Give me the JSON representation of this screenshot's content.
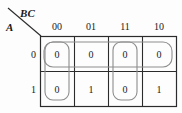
{
  "kmap": {
    "corner": {
      "col_vars": "BC",
      "row_var": "A"
    },
    "col_headers": [
      "00",
      "01",
      "11",
      "10"
    ],
    "row_headers": [
      "0",
      "1"
    ],
    "rows": [
      {
        "label": "0",
        "cells": [
          "0",
          "0",
          "0",
          "0"
        ]
      },
      {
        "label": "1",
        "cells": [
          "0",
          "1",
          "0",
          "1"
        ]
      }
    ],
    "groups": [
      {
        "name": "row-0-group",
        "orientation": "horizontal",
        "row": 0,
        "cols": [
          0,
          1,
          2,
          3
        ]
      },
      {
        "name": "col-00-group",
        "orientation": "vertical",
        "col": 0,
        "rows": [
          0,
          1
        ]
      },
      {
        "name": "col-11-group",
        "orientation": "vertical",
        "col": 2,
        "rows": [
          0,
          1
        ]
      }
    ],
    "colors": {
      "grid_line": "#2b2b2b",
      "group_line": "#8d8d8d",
      "text": "#1a1a1a",
      "background": "#fdfdfd"
    }
  }
}
